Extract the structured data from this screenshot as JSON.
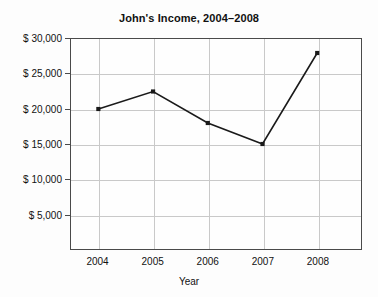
{
  "chart_data": {
    "type": "line",
    "title": "John's Income, 2004–2008",
    "xlabel": "Year",
    "ylabel": "",
    "categories": [
      "2004",
      "2005",
      "2006",
      "2007",
      "2008"
    ],
    "x": [
      2004,
      2005,
      2006,
      2007,
      2008
    ],
    "values": [
      20000,
      22500,
      18000,
      15000,
      28000
    ],
    "series": [
      {
        "name": "John's Income",
        "values": [
          20000,
          22500,
          18000,
          15000,
          28000
        ]
      }
    ],
    "ylim": [
      0,
      30000
    ],
    "xlim": [
      2003.5,
      2008.8
    ],
    "y_ticks": [
      5000,
      10000,
      15000,
      20000,
      25000,
      30000
    ],
    "y_tick_labels": [
      "$ 5,000",
      "$ 10,000",
      "$ 15,000",
      "$ 20,000",
      "$ 25,000",
      "$ 30,000"
    ],
    "x_tick_labels": [
      "2004",
      "2005",
      "2006",
      "2007",
      "2008"
    ],
    "grid": true,
    "legend": "none",
    "marker": "square",
    "line_color": "#1a1a1a",
    "grid_color": "#c9c9c9",
    "axis_color": "#4a4a4a",
    "background_color": "#fdfdfd"
  }
}
